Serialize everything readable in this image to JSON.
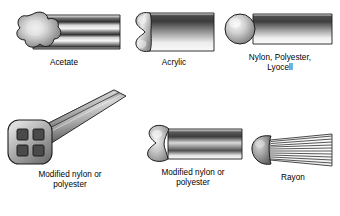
{
  "page": {
    "background_color": "#ffffff",
    "text_color": "#000000"
  },
  "figures": [
    {
      "id": "acetate",
      "caption": "Acetate",
      "cross_section": "multi-lobal",
      "lobes": 5,
      "surface": "striated",
      "icon_name": "acetate-fiber-icon"
    },
    {
      "id": "acrylic",
      "caption": "Acrylic",
      "cross_section": "dog-bone / peanut",
      "lobes": 2,
      "surface": "smooth",
      "icon_name": "acrylic-fiber-icon"
    },
    {
      "id": "round",
      "caption": "Nylon, Polyester,\nLyocell",
      "cross_section": "round",
      "lobes": 0,
      "surface": "smooth",
      "icon_name": "round-fiber-icon"
    },
    {
      "id": "hollow",
      "caption": "Modified nylon or\npolyester",
      "cross_section": "rounded square, hollow",
      "voids": 4,
      "surface": "smooth",
      "icon_name": "hollow-fiber-icon"
    },
    {
      "id": "trilobal",
      "caption": "Modified nylon or\npolyester",
      "cross_section": "trilobal",
      "lobes": 3,
      "surface": "smooth",
      "icon_name": "trilobal-fiber-icon"
    },
    {
      "id": "rayon",
      "caption": "Rayon",
      "cross_section": "serrated round",
      "lobes": 0,
      "surface": "striated",
      "icon_name": "rayon-fiber-icon"
    }
  ],
  "colors": {
    "shade_dark": "#3a3a3a",
    "shade_mid": "#8a8a8a",
    "shade_light": "#f2f2f2",
    "outline": "#1d1d1d"
  }
}
